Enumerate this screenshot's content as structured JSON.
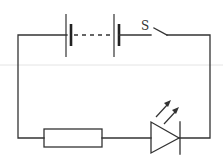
{
  "diagram": {
    "type": "circuit",
    "components": [
      {
        "id": "cell-1",
        "kind": "battery-cell"
      },
      {
        "id": "cell-2",
        "kind": "battery-cell"
      },
      {
        "id": "switch",
        "kind": "switch",
        "label": "S",
        "state": "open"
      },
      {
        "id": "resistor",
        "kind": "resistor"
      },
      {
        "id": "led",
        "kind": "light-emitting-diode"
      }
    ],
    "connections": "series loop: battery cells → switch S → right wire → LED → resistor → left wire → battery",
    "colors": {
      "wire": "#333333",
      "background": "#ffffff"
    }
  }
}
